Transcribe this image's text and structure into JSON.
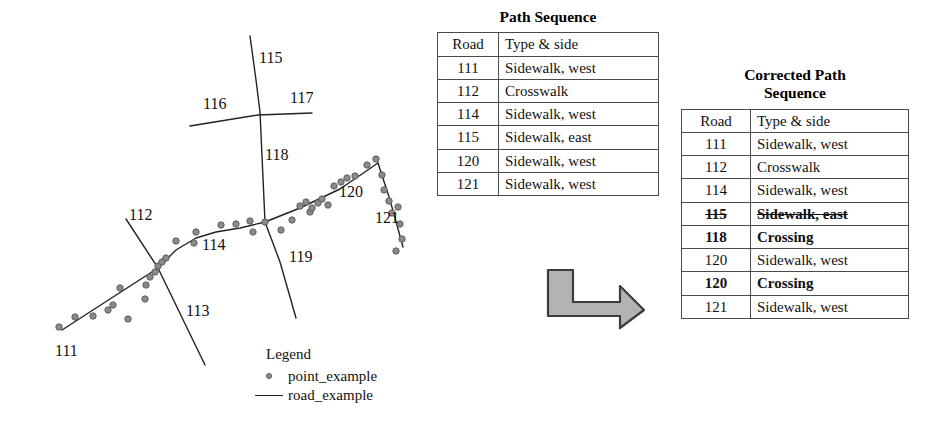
{
  "map": {
    "title": "road network path map",
    "road_labels": [
      {
        "id": "111",
        "text": "111",
        "x": 55,
        "y": 343
      },
      {
        "id": "112",
        "text": "112",
        "x": 129,
        "y": 207
      },
      {
        "id": "113",
        "text": "113",
        "x": 186,
        "y": 303
      },
      {
        "id": "114",
        "text": "114",
        "x": 202,
        "y": 237
      },
      {
        "id": "115",
        "text": "115",
        "x": 259,
        "y": 50
      },
      {
        "id": "116",
        "text": "116",
        "x": 203,
        "y": 96
      },
      {
        "id": "117",
        "text": "117",
        "x": 290,
        "y": 90
      },
      {
        "id": "118",
        "text": "118",
        "x": 265,
        "y": 147
      },
      {
        "id": "119",
        "text": "119",
        "x": 289,
        "y": 249
      },
      {
        "id": "120",
        "text": "120",
        "x": 339,
        "y": 184
      },
      {
        "id": "121",
        "text": "121",
        "x": 375,
        "y": 210
      }
    ],
    "point_color": "#8a8a8a",
    "point_stroke": "#5a5a5a",
    "road_color": "#222222"
  },
  "legend": {
    "title": "Legend",
    "entries": [
      {
        "key": "point",
        "label": "point_example"
      },
      {
        "key": "line",
        "label": "road_example"
      }
    ]
  },
  "tables": {
    "path_sequence": {
      "title": "Path Sequence",
      "columns": [
        "Road",
        "Type & side"
      ],
      "rows": [
        {
          "road": "111",
          "type": "Sidewalk, west",
          "style": "normal"
        },
        {
          "road": "112",
          "type": "Crosswalk",
          "style": "normal"
        },
        {
          "road": "114",
          "type": "Sidewalk, west",
          "style": "normal"
        },
        {
          "road": "115",
          "type": "Sidewalk, east",
          "style": "normal"
        },
        {
          "road": "120",
          "type": "Sidewalk, west",
          "style": "normal"
        },
        {
          "road": "121",
          "type": "Sidewalk, west",
          "style": "normal"
        }
      ]
    },
    "corrected_path_sequence": {
      "title": "Corrected Path\nSequence",
      "columns": [
        "Road",
        "Type & side"
      ],
      "rows": [
        {
          "road": "111",
          "type": "Sidewalk, west",
          "style": "normal"
        },
        {
          "road": "112",
          "type": "Crosswalk",
          "style": "normal"
        },
        {
          "road": "114",
          "type": "Sidewalk, west",
          "style": "normal"
        },
        {
          "road": "115",
          "type": "Sidewalk, east",
          "style": "strike"
        },
        {
          "road": "118",
          "type": "Crossing",
          "style": "bold"
        },
        {
          "road": "120",
          "type": "Sidewalk, west",
          "style": "normal"
        },
        {
          "road": "120",
          "type": "Crossing",
          "style": "bold"
        },
        {
          "road": "121",
          "type": "Sidewalk, west",
          "style": "normal"
        }
      ]
    }
  },
  "arrow": {
    "name": "corrects-to-arrow",
    "fill": "#b3b3b3",
    "stroke": "#3c3c3c"
  },
  "chart_data": {
    "type": "scatter",
    "xlabel": "",
    "ylabel": "",
    "roads": [
      {
        "id": "111",
        "polyline": [
          [
            62,
            330
          ],
          [
            158,
            268
          ]
        ]
      },
      {
        "id": "114",
        "polyline": [
          [
            158,
            268
          ],
          [
            176,
            250
          ],
          [
            196,
            238
          ],
          [
            216,
            232
          ],
          [
            240,
            228
          ],
          [
            265,
            222
          ]
        ]
      },
      {
        "id": "120",
        "polyline": [
          [
            265,
            222
          ],
          [
            300,
            208
          ],
          [
            340,
            189
          ],
          [
            378,
            163
          ]
        ]
      },
      {
        "id": "121",
        "polyline": [
          [
            378,
            163
          ],
          [
            390,
            200
          ],
          [
            403,
            247
          ]
        ]
      },
      {
        "id": "112-113",
        "polyline": [
          [
            126,
            219
          ],
          [
            158,
            268
          ],
          [
            205,
            365
          ]
        ]
      },
      {
        "id": "115-118",
        "polyline": [
          [
            250,
            36
          ],
          [
            256,
            80
          ],
          [
            260,
            112
          ],
          [
            265,
            222
          ]
        ]
      },
      {
        "id": "116-117",
        "polyline": [
          [
            190,
            126
          ],
          [
            258,
            115
          ],
          [
            312,
            113
          ]
        ]
      },
      {
        "id": "119",
        "polyline": [
          [
            265,
            222
          ],
          [
            280,
            262
          ],
          [
            296,
            318
          ]
        ]
      }
    ],
    "points": [
      [
        59,
        327
      ],
      [
        75,
        317
      ],
      [
        93,
        316
      ],
      [
        108,
        310
      ],
      [
        128,
        319
      ],
      [
        113,
        305
      ],
      [
        120,
        288
      ],
      [
        145,
        299
      ],
      [
        146,
        285
      ],
      [
        150,
        277
      ],
      [
        155,
        272
      ],
      [
        158,
        266
      ],
      [
        162,
        262
      ],
      [
        166,
        258
      ],
      [
        176,
        241
      ],
      [
        194,
        243
      ],
      [
        196,
        232
      ],
      [
        221,
        225
      ],
      [
        236,
        224
      ],
      [
        250,
        221
      ],
      [
        253,
        232
      ],
      [
        265,
        222
      ],
      [
        281,
        230
      ],
      [
        292,
        220
      ],
      [
        300,
        206
      ],
      [
        306,
        202
      ],
      [
        310,
        212
      ],
      [
        312,
        208
      ],
      [
        318,
        203
      ],
      [
        322,
        199
      ],
      [
        328,
        205
      ],
      [
        334,
        186
      ],
      [
        341,
        182
      ],
      [
        347,
        178
      ],
      [
        355,
        176
      ],
      [
        367,
        165
      ],
      [
        376,
        159
      ],
      [
        382,
        175
      ],
      [
        384,
        190
      ],
      [
        389,
        201
      ],
      [
        392,
        213
      ],
      [
        398,
        207
      ],
      [
        400,
        224
      ],
      [
        402,
        239
      ],
      [
        396,
        251
      ]
    ],
    "legend_position": "bottom-center"
  }
}
